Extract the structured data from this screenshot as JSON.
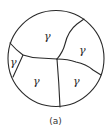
{
  "figure": {
    "caption": "(a)",
    "phase_symbol": "γ",
    "grains": [
      {
        "id": "top",
        "label": "γ"
      },
      {
        "id": "right-upper",
        "label": "γ"
      },
      {
        "id": "left-small",
        "label": "γ"
      },
      {
        "id": "bottom-center",
        "label": "γ"
      },
      {
        "id": "bottom-right",
        "label": "γ"
      }
    ],
    "grain_count": 5,
    "colors": {
      "line": "#2a2a2a",
      "background": "#ffffff"
    }
  }
}
